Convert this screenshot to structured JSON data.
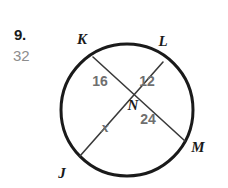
{
  "problem": {
    "number": "9.",
    "answer": "32"
  },
  "figure": {
    "type": "circle-with-intersecting-chords",
    "colors": {
      "stroke": "#1a1a1a",
      "chord_stroke": "#3a3a3a",
      "label_gray": "#6f6f6f",
      "answer_gray": "#8d8d8d",
      "background": "#ffffff"
    },
    "circle": {
      "cx": 127,
      "cy": 110,
      "r": 66,
      "stroke_width": 3
    },
    "points": [
      {
        "name": "K",
        "label": "K",
        "x": 93,
        "y": 57,
        "label_x": 82,
        "label_y": 44
      },
      {
        "name": "L",
        "label": "L",
        "x": 163,
        "y": 62,
        "label_x": 163,
        "label_y": 46
      },
      {
        "name": "M",
        "label": "M",
        "x": 185,
        "y": 141,
        "label_x": 198,
        "label_y": 152
      },
      {
        "name": "J",
        "label": "J",
        "x": 80,
        "y": 156,
        "label_x": 62,
        "label_y": 178
      },
      {
        "name": "N",
        "label": "N",
        "x": 137,
        "y": 87,
        "label_x": 133,
        "label_y": 110
      }
    ],
    "chords": [
      {
        "name": "chord-KM",
        "from": "K",
        "to": "M",
        "x1": 93,
        "y1": 57,
        "x2": 185,
        "y2": 141
      },
      {
        "name": "chord-LJ",
        "from": "L",
        "to": "J",
        "x1": 163,
        "y1": 62,
        "x2": 80,
        "y2": 156
      }
    ],
    "segment_labels": [
      {
        "name": "segment-label-kn",
        "text": "16",
        "x": 100,
        "y": 86,
        "italic": false
      },
      {
        "name": "segment-label-ln",
        "text": "12",
        "x": 147,
        "y": 86,
        "italic": false
      },
      {
        "name": "segment-label-nm",
        "text": "24",
        "x": 148,
        "y": 124,
        "italic": false
      },
      {
        "name": "segment-label-nj",
        "text": "x",
        "x": 105,
        "y": 132,
        "italic": true
      }
    ]
  }
}
